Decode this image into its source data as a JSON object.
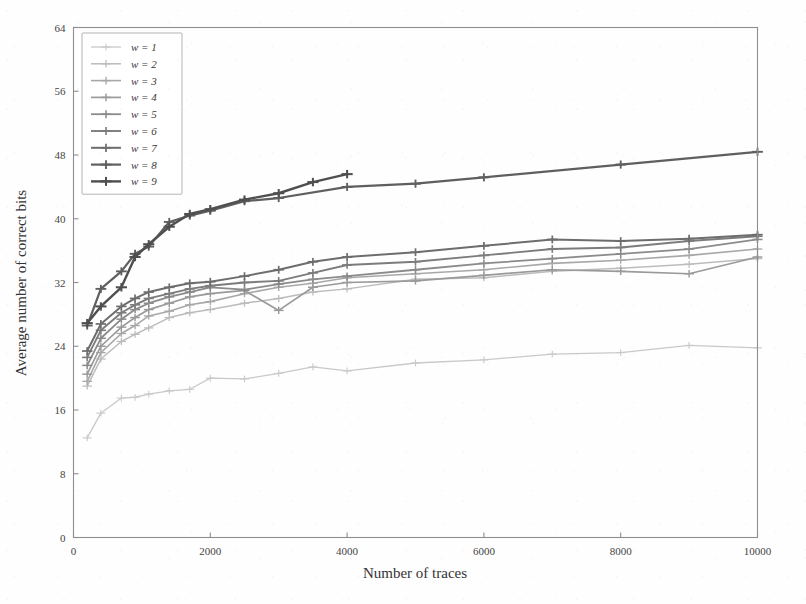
{
  "chart_data": {
    "type": "line",
    "title": "",
    "xlabel": "Number of traces",
    "ylabel": "Average number of correct bits",
    "xlim": [
      0,
      10000
    ],
    "ylim": [
      0,
      64
    ],
    "xticks": [
      0,
      2000,
      4000,
      6000,
      8000,
      10000
    ],
    "yticks": [
      0,
      8,
      16,
      24,
      32,
      40,
      48,
      56,
      64
    ],
    "xticklabels": [
      "0",
      "2000",
      "4000",
      "6000",
      "8000",
      "10000"
    ],
    "yticklabels": [
      "0",
      "8",
      "16",
      "24",
      "32",
      "40",
      "48",
      "56",
      "64"
    ],
    "grid": false,
    "legend_position": "upper left",
    "marker": "plus",
    "series": [
      {
        "name": "w = 1",
        "legend_label": "w = 1",
        "color": "#c9c9c9",
        "width": 1.3,
        "x": [
          200,
          400,
          700,
          900,
          1100,
          1400,
          1700,
          2000,
          2500,
          3000,
          3500,
          4000,
          5000,
          6000,
          7000,
          8000,
          9000,
          10000
        ],
        "y": [
          12.5,
          15.6,
          17.5,
          17.6,
          18.0,
          18.4,
          18.6,
          20.0,
          19.9,
          20.6,
          21.4,
          20.9,
          21.9,
          22.3,
          23.0,
          23.2,
          24.1,
          23.8
        ]
      },
      {
        "name": "w = 2",
        "legend_label": "w = 2",
        "color": "#bcbcbc",
        "width": 1.5,
        "x": [
          200,
          400,
          700,
          900,
          1100,
          1400,
          1700,
          2000,
          2500,
          3000,
          3500,
          4000,
          5000,
          6000,
          7000,
          8000,
          9000,
          10000
        ],
        "y": [
          19.0,
          22.4,
          24.6,
          25.5,
          26.3,
          27.6,
          28.2,
          28.6,
          29.4,
          30.0,
          30.8,
          31.2,
          32.4,
          32.6,
          33.4,
          33.8,
          34.3,
          35.0
        ]
      },
      {
        "name": "w = 3",
        "legend_label": "w = 3",
        "color": "#a8a8a8",
        "width": 1.6,
        "x": [
          200,
          400,
          700,
          900,
          1100,
          1400,
          1700,
          2000,
          2500,
          3000,
          3500,
          4000,
          5000,
          6000,
          7000,
          8000,
          9000,
          10000
        ],
        "y": [
          19.6,
          23.2,
          25.6,
          26.6,
          27.8,
          28.4,
          29.2,
          29.6,
          30.6,
          31.4,
          31.9,
          32.6,
          33.1,
          33.6,
          34.4,
          34.8,
          35.4,
          36.2
        ]
      },
      {
        "name": "w = 4",
        "legend_label": "w = 4",
        "color": "#9a9a9a",
        "width": 1.7,
        "x": [
          200,
          400,
          700,
          900,
          1100,
          1400,
          1700,
          2000,
          2500,
          3000,
          3500,
          4000,
          5000,
          6000,
          7000,
          8000,
          9000,
          10000
        ],
        "y": [
          20.5,
          24.0,
          26.4,
          27.6,
          28.6,
          29.4,
          30.2,
          30.6,
          31.0,
          28.5,
          31.4,
          32.0,
          32.2,
          32.9,
          33.6,
          33.4,
          33.1,
          35.2
        ]
      },
      {
        "name": "w = 5",
        "legend_label": "w = 5",
        "color": "#8b8b8b",
        "width": 1.8,
        "x": [
          200,
          400,
          700,
          900,
          1100,
          1400,
          1700,
          2000,
          2500,
          3000,
          3500,
          4000,
          5000,
          6000,
          7000,
          8000,
          9000,
          10000
        ],
        "y": [
          21.6,
          25.0,
          27.4,
          28.6,
          29.4,
          30.2,
          30.8,
          31.4,
          31.1,
          31.8,
          32.4,
          32.8,
          33.6,
          34.4,
          35.0,
          35.6,
          36.2,
          37.4
        ]
      },
      {
        "name": "w = 6",
        "legend_label": "w = 6",
        "color": "#7c7c7c",
        "width": 1.9,
        "x": [
          200,
          400,
          700,
          900,
          1100,
          1400,
          1700,
          2000,
          2500,
          3000,
          3500,
          4000,
          5000,
          6000,
          7000,
          8000,
          9000,
          10000
        ],
        "y": [
          22.6,
          26.0,
          28.2,
          29.2,
          30.0,
          30.6,
          31.2,
          31.6,
          32.0,
          32.2,
          33.2,
          34.2,
          34.6,
          35.4,
          36.2,
          36.4,
          37.2,
          37.8
        ]
      },
      {
        "name": "w = 7",
        "legend_label": "w = 7",
        "color": "#6d6d6d",
        "width": 2.0,
        "x": [
          200,
          400,
          700,
          900,
          1100,
          1400,
          1700,
          2000,
          2500,
          3000,
          3500,
          4000,
          5000,
          6000,
          7000,
          8000,
          9000,
          10000
        ],
        "y": [
          23.4,
          26.8,
          29.0,
          30.0,
          30.8,
          31.4,
          31.9,
          32.1,
          32.8,
          33.6,
          34.6,
          35.2,
          35.8,
          36.6,
          37.4,
          37.2,
          37.5,
          38.0
        ]
      },
      {
        "name": "w = 8",
        "legend_label": "w = 8",
        "color": "#5f5f5f",
        "width": 2.2,
        "x": [
          200,
          400,
          700,
          900,
          1100,
          1400,
          1700,
          2000,
          2500,
          3000,
          4000,
          5000,
          6000,
          8000,
          10000
        ],
        "y": [
          26.6,
          31.2,
          33.4,
          35.6,
          36.5,
          39.6,
          40.4,
          41.0,
          42.2,
          42.6,
          44.0,
          44.4,
          45.2,
          46.8,
          48.4
        ]
      },
      {
        "name": "w = 9",
        "legend_label": "w = 9",
        "color": "#4f4f4f",
        "width": 2.4,
        "x": [
          200,
          400,
          700,
          900,
          1100,
          1400,
          1700,
          2000,
          2500,
          3000,
          3500,
          4000
        ],
        "y": [
          26.9,
          29.0,
          31.4,
          35.2,
          36.8,
          39.0,
          40.6,
          41.2,
          42.4,
          43.2,
          44.6,
          45.6
        ]
      }
    ]
  }
}
